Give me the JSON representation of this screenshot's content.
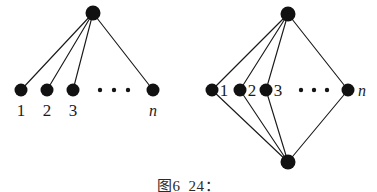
{
  "figure": {
    "caption": "图6_24：",
    "background_color": "#ffffff",
    "ink_color": "#111111",
    "edge_color": "#1a1a1a"
  },
  "chart_data": {
    "type": "diagram",
    "title": "图6_24：",
    "subtitle": "",
    "xlabel": "",
    "ylabel": "",
    "graphs": [
      {
        "name": "star-graph",
        "position": "left",
        "description": "star graph with one apex vertex joined to n leaf vertices",
        "vertices": [
          {
            "id": "apex",
            "label": "",
            "x": 93,
            "y": 13,
            "r": 7.5
          },
          {
            "id": "v1",
            "label": "1",
            "x": 21,
            "y": 90,
            "r": 6.5
          },
          {
            "id": "v2",
            "label": "2",
            "x": 47,
            "y": 90,
            "r": 6.5
          },
          {
            "id": "v3",
            "label": "3",
            "x": 73,
            "y": 90,
            "r": 6.5
          },
          {
            "id": "vn",
            "label": "n",
            "x": 153,
            "y": 90,
            "r": 6.5
          }
        ],
        "edges": [
          [
            "apex",
            "v1"
          ],
          [
            "apex",
            "v2"
          ],
          [
            "apex",
            "v3"
          ],
          [
            "apex",
            "vn"
          ]
        ],
        "ellipsis": {
          "dots": 3,
          "x": [
            100,
            114,
            128
          ],
          "y": 90,
          "r": 2.2
        },
        "labels": [
          {
            "text": "1",
            "x": 21,
            "y": 116,
            "italic": false
          },
          {
            "text": "2",
            "x": 47,
            "y": 116,
            "italic": false
          },
          {
            "text": "3",
            "x": 73,
            "y": 116,
            "italic": false
          },
          {
            "text": "n",
            "x": 153,
            "y": 116,
            "italic": true
          }
        ]
      },
      {
        "name": "double-star-graph",
        "position": "right",
        "description": "two apex vertices (top and bottom) each joined to the same n middle vertices",
        "vertices": [
          {
            "id": "top",
            "label": "",
            "x": 288,
            "y": 14,
            "r": 7.5
          },
          {
            "id": "bottom",
            "label": "",
            "x": 288,
            "y": 162,
            "r": 7.5
          },
          {
            "id": "u1",
            "label": "1",
            "x": 212,
            "y": 90,
            "r": 6.5
          },
          {
            "id": "u2",
            "label": "2",
            "x": 240,
            "y": 90,
            "r": 6.5
          },
          {
            "id": "u3",
            "label": "3",
            "x": 266,
            "y": 90,
            "r": 6.5
          },
          {
            "id": "un",
            "label": "n",
            "x": 348,
            "y": 90,
            "r": 6.5
          }
        ],
        "edges": [
          [
            "top",
            "u1"
          ],
          [
            "top",
            "u2"
          ],
          [
            "top",
            "u3"
          ],
          [
            "top",
            "un"
          ],
          [
            "bottom",
            "u1"
          ],
          [
            "bottom",
            "u2"
          ],
          [
            "bottom",
            "u3"
          ],
          [
            "bottom",
            "un"
          ]
        ],
        "ellipsis": {
          "dots": 3,
          "x": [
            301,
            314,
            327
          ],
          "y": 90,
          "r": 2.2
        },
        "labels": [
          {
            "text": "1",
            "x": 224,
            "y": 96,
            "italic": false
          },
          {
            "text": "2",
            "x": 252,
            "y": 96,
            "italic": false
          },
          {
            "text": "3",
            "x": 278,
            "y": 96,
            "italic": false
          },
          {
            "text": "n",
            "x": 362,
            "y": 96,
            "italic": true
          }
        ]
      }
    ]
  }
}
